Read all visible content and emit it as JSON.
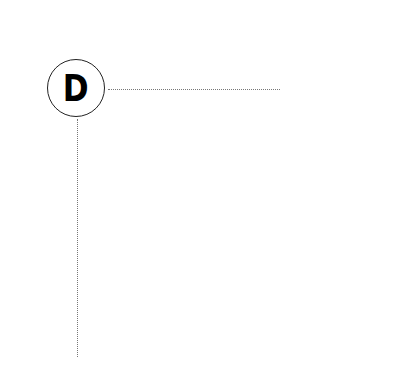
{
  "node": {
    "label": "D",
    "border_color": "#222222"
  },
  "connectors": [
    {
      "direction": "horizontal",
      "style": "dotted",
      "color": "#777777"
    },
    {
      "direction": "vertical",
      "style": "dotted",
      "color": "#777777"
    }
  ]
}
